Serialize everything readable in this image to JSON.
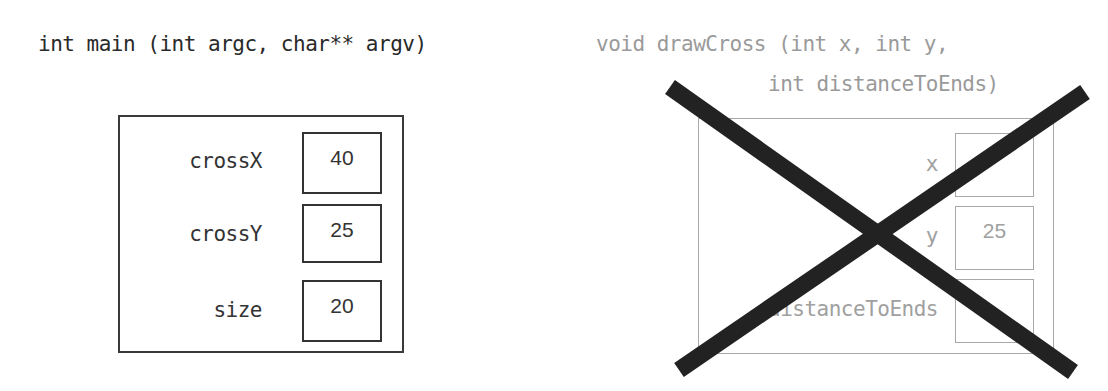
{
  "main_frame": {
    "signature": "int main (int argc, char** argv)",
    "variables": [
      {
        "name": "crossX",
        "value": "40"
      },
      {
        "name": "crossY",
        "value": "25"
      },
      {
        "name": "size",
        "value": "20"
      }
    ]
  },
  "drawcross_frame": {
    "signature_line1": "void drawCross (int x, int y,",
    "signature_line2": "int distanceToEnds)",
    "crossed_out": true,
    "variables": [
      {
        "name": "x",
        "value": "",
        "note": "value obscured by cross; only fragment '…0' visible"
      },
      {
        "name": "y",
        "value": "25"
      },
      {
        "name": "distanceToEnds",
        "value": "",
        "note": "value obscured by cross; only fragment '…0' visible"
      }
    ]
  },
  "colors": {
    "active": "#333333",
    "faded": "#a0a0a0",
    "cross": "#222222"
  }
}
